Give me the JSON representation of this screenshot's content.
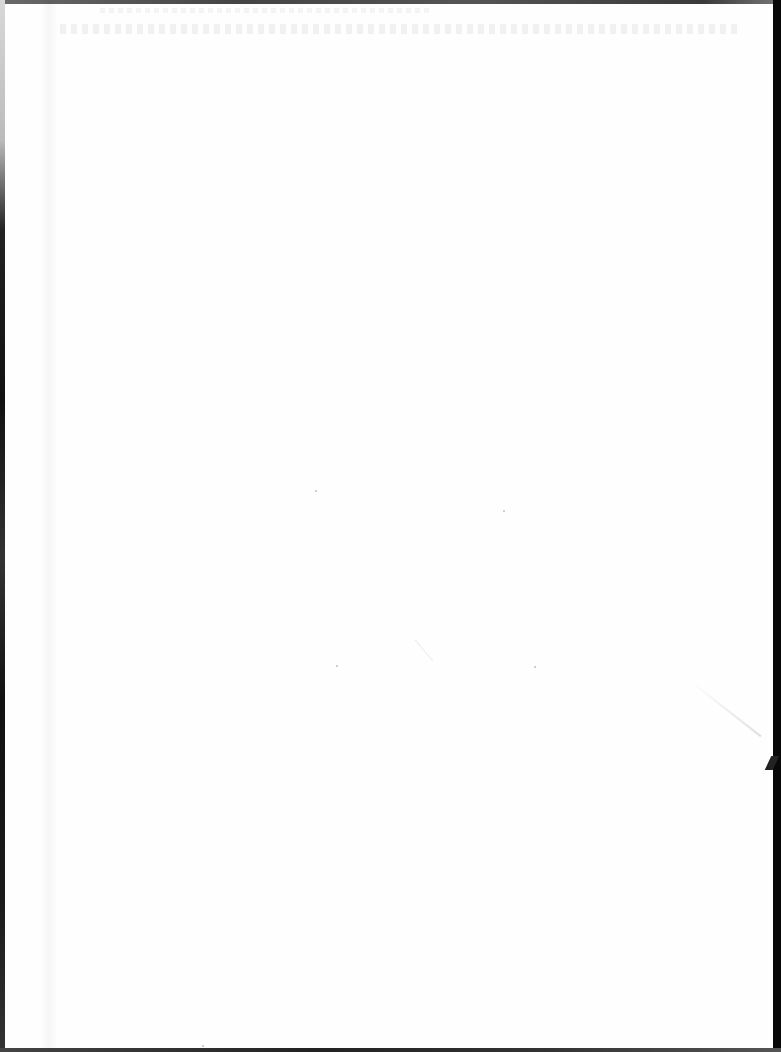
{
  "document": {
    "type": "scanned-page",
    "content": "",
    "visible_text": [],
    "page_color": "#fefefe",
    "scanner_edge_color": "#080808"
  }
}
